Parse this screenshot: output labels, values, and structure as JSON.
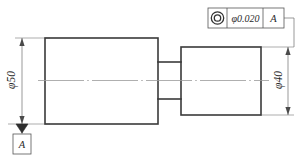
{
  "drawing": {
    "title": "Stepped shaft with concentricity tolerance",
    "background_color": "#ffffff",
    "line_color": "#3a3a3a",
    "thin_line_color": "#8a8a8a"
  },
  "feature_control_frame": {
    "symbol_name": "concentricity-symbol",
    "symbol_glyph": "◎",
    "tolerance": "φ0.020",
    "datum_reference": "A"
  },
  "datum_feature": {
    "label": "A",
    "symbol_name": "datum-triangle"
  },
  "dimensions": [
    {
      "name": "diameter-50",
      "label": "φ50",
      "position": "left",
      "value": 50
    },
    {
      "name": "diameter-40",
      "label": "φ40",
      "position": "right",
      "value": 40
    }
  ],
  "geometry": {
    "large_cylinder": {
      "name": "large-cylinder-body",
      "diameter": 50
    },
    "neck": {
      "name": "neck-section"
    },
    "small_cylinder": {
      "name": "small-cylinder-body",
      "diameter": 40
    },
    "centerline": {
      "name": "axis-centerline"
    }
  }
}
